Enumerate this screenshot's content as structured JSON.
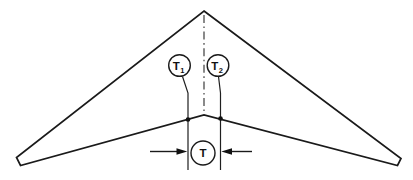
{
  "diagram": {
    "labels": {
      "t1": {
        "main": "T",
        "sub": "1"
      },
      "t2": {
        "main": "T",
        "sub": "2"
      },
      "t": "T"
    },
    "colors": {
      "line": "#1a1a1a",
      "background": "#ffffff"
    }
  }
}
